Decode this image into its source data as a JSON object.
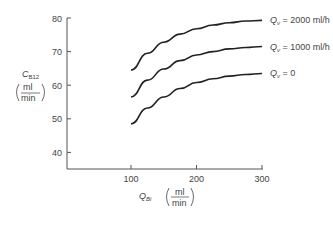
{
  "chart_data": {
    "type": "line",
    "title": "",
    "xlabel": "Q_Bi (ml/min)",
    "ylabel": "C_B12 (ml/min)",
    "xlim": [
      0,
      300
    ],
    "ylim": [
      35,
      80
    ],
    "x_ticks": [
      "100",
      "200",
      "300"
    ],
    "y_ticks": [
      "40",
      "50",
      "60",
      "70",
      "80"
    ],
    "grid": false,
    "legend_position": "inline-right",
    "x": [
      100,
      125,
      150,
      175,
      200,
      225,
      250,
      275,
      300
    ],
    "series": [
      {
        "name": "Q_v = 2000 ml/h",
        "label_main": "Q",
        "label_sub": "v",
        "label_rest": " = 2000 ml/h",
        "values": [
          64.5,
          69.5,
          72.8,
          75.2,
          76.8,
          77.9,
          78.6,
          79.1,
          79.3
        ]
      },
      {
        "name": "Q_v = 1000 ml/h",
        "label_main": "Q",
        "label_sub": "v",
        "label_rest": " = 1000 ml/h",
        "values": [
          56.5,
          61.5,
          64.8,
          67.3,
          69.0,
          70.0,
          70.8,
          71.2,
          71.5
        ]
      },
      {
        "name": "Q_v = 0",
        "label_main": "Q",
        "label_sub": "v",
        "label_rest": " = 0",
        "values": [
          48.5,
          53.2,
          56.5,
          59.0,
          60.8,
          61.9,
          62.7,
          63.2,
          63.5
        ]
      }
    ]
  },
  "axes": {
    "y_title_main": "C",
    "y_title_sub": "B12",
    "y_unit_num": "ml",
    "y_unit_den": "min",
    "x_title_main": "Q",
    "x_title_sub": "Bi",
    "x_unit_num": "ml",
    "x_unit_den": "min"
  }
}
